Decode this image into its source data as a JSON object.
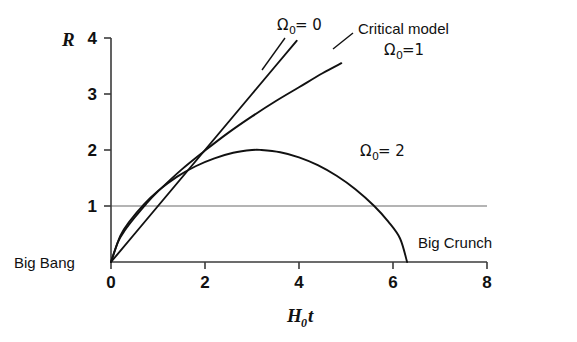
{
  "figure": {
    "background_color": "#ffffff",
    "axis_color": "#3b3b3b",
    "curve_color": "#111111",
    "reference_line_color": "#6a6a6a"
  },
  "axes": {
    "y_name": "R",
    "x_name_base": "H",
    "x_name_sub": "0",
    "x_name_tail": "t",
    "y_ticks": [
      "1",
      "2",
      "3",
      "4"
    ],
    "x_ticks": [
      "0",
      "2",
      "4",
      "6",
      "8"
    ]
  },
  "annotations": {
    "omega0_label": {
      "symbol": "Ω",
      "sub": "0",
      "rel": " = 0"
    },
    "critical_title": "Critical model",
    "omega1_label": {
      "symbol": "Ω",
      "sub": "0",
      "rel": "=1"
    },
    "omega2_label": {
      "symbol": "Ω",
      "sub": "0",
      "rel": " = 2"
    },
    "big_bang": "Big Bang",
    "big_crunch": "Big Crunch"
  },
  "chart_data": {
    "type": "line",
    "title": "",
    "xlabel": "H_0 t",
    "ylabel": "R",
    "xlim": [
      0,
      8
    ],
    "ylim": [
      0,
      4
    ],
    "grid": false,
    "legend": "inline-annotations",
    "x_ticks": [
      0,
      2,
      4,
      6,
      8
    ],
    "y_ticks": [
      1,
      2,
      3,
      4
    ],
    "reference_lines": [
      {
        "name": "R = 1 (present scale factor)",
        "axis": "y",
        "value": 1,
        "x_range": [
          0,
          8
        ]
      }
    ],
    "series": [
      {
        "name": "Omega_0 = 0",
        "description": "Empty (Milne) universe, R = H0*t, expands forever at constant rate",
        "label": "Ω₀ = 0",
        "points": [
          [
            0.0,
            0.0
          ],
          [
            0.5,
            0.5
          ],
          [
            1.0,
            1.0
          ],
          [
            1.5,
            1.5
          ],
          [
            2.0,
            2.0
          ],
          [
            2.5,
            2.5
          ],
          [
            3.0,
            3.0
          ],
          [
            3.5,
            3.5
          ],
          [
            3.95,
            3.95
          ]
        ]
      },
      {
        "name": "Omega_0 = 1",
        "description": "Critical / Einstein-de Sitter model, R proportional to t^(2/3), expands forever but decelerating",
        "label": "Ω₀=1",
        "points": [
          [
            0.0,
            0.0
          ],
          [
            0.15,
            0.36
          ],
          [
            0.3,
            0.57
          ],
          [
            0.5,
            0.79
          ],
          [
            0.75,
            1.04
          ],
          [
            1.0,
            1.26
          ],
          [
            1.5,
            1.65
          ],
          [
            2.0,
            1.99
          ],
          [
            2.5,
            2.31
          ],
          [
            3.0,
            2.6
          ],
          [
            3.5,
            2.87
          ],
          [
            4.0,
            3.12
          ],
          [
            4.5,
            3.37
          ],
          [
            4.9,
            3.55
          ]
        ]
      },
      {
        "name": "Omega_0 = 2",
        "description": "Closed universe, cycloid: expands to maximum R = 2 then recollapses to a Big Crunch",
        "label": "Ω₀ = 2",
        "points": [
          [
            0.0,
            0.0
          ],
          [
            0.2,
            0.47
          ],
          [
            0.4,
            0.73
          ],
          [
            0.7,
            1.03
          ],
          [
            1.0,
            1.27
          ],
          [
            1.4,
            1.52
          ],
          [
            1.8,
            1.71
          ],
          [
            2.2,
            1.85
          ],
          [
            2.6,
            1.95
          ],
          [
            3.0,
            2.0
          ],
          [
            3.2,
            2.0
          ],
          [
            3.6,
            1.96
          ],
          [
            4.0,
            1.87
          ],
          [
            4.4,
            1.73
          ],
          [
            4.8,
            1.54
          ],
          [
            5.2,
            1.3
          ],
          [
            5.6,
            1.0
          ],
          [
            5.9,
            0.72
          ],
          [
            6.15,
            0.42
          ],
          [
            6.3,
            0.0
          ]
        ],
        "peak": {
          "x": 3.1,
          "y": 2.0
        },
        "end_event": "Big Crunch"
      }
    ]
  }
}
